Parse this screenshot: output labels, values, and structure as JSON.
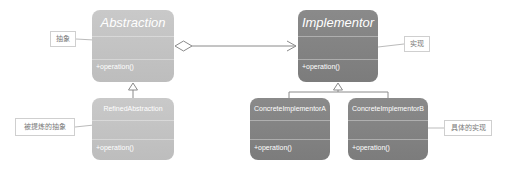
{
  "diagram": {
    "type": "UML class diagram - Bridge pattern",
    "classes": {
      "abstraction": {
        "name": "Abstraction",
        "operation": "+operation()"
      },
      "implementor": {
        "name": "Implementor",
        "operation": "+operation()"
      },
      "refined_abstraction": {
        "name": "RefinedAbstraction",
        "operation": "+operation()"
      },
      "concrete_implementor_a": {
        "name": "ConcreteImplementorA",
        "operation": "+operation()"
      },
      "concrete_implementor_b": {
        "name": "ConcreteImplementorB",
        "operation": "+operation()"
      }
    },
    "notes": {
      "abstraction": "抽象",
      "implementor": "实现",
      "refined_abstraction": "被提炼的抽象",
      "concrete_implementor": "具体的实现"
    },
    "relations": [
      {
        "from": "Abstraction",
        "to": "Implementor",
        "kind": "aggregation"
      },
      {
        "from": "RefinedAbstraction",
        "to": "Abstraction",
        "kind": "generalization"
      },
      {
        "from": "ConcreteImplementorA",
        "to": "Implementor",
        "kind": "generalization"
      },
      {
        "from": "ConcreteImplementorB",
        "to": "Implementor",
        "kind": "generalization"
      }
    ],
    "colors": {
      "abstraction_fill": "#c4c4c4",
      "implementor_fill": "#848484",
      "line": "#8a8a8a",
      "note_border": "#cfcfcf"
    }
  }
}
